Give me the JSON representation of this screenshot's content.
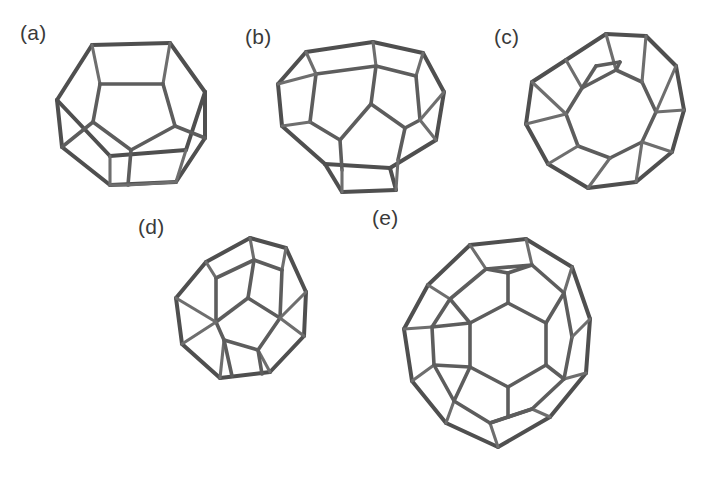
{
  "figure": {
    "type": "line-drawing-figure",
    "background_color": "#ffffff",
    "stroke_color": "#5d5d5d",
    "panel_count": 5
  },
  "panels": [
    {
      "id": "a",
      "label": "(a)",
      "label_x": 20,
      "label_y": 22,
      "shape_name": "pentagonal-dodecahedron",
      "faces": 12,
      "vertices": 20,
      "edges": 30,
      "box": {
        "x": 50,
        "y": 30,
        "width": 162,
        "height": 158
      }
    },
    {
      "id": "b",
      "label": "(b)",
      "label_x": 245,
      "label_y": 26,
      "shape_name": "tetrakaidecahedron",
      "faces": 14,
      "vertices": 24,
      "edges": 36,
      "box": {
        "x": 262,
        "y": 33,
        "width": 192,
        "height": 155
      }
    },
    {
      "id": "c",
      "label": "(c)",
      "label_x": 494,
      "label_y": 26,
      "shape_name": "hexakaidecahedron",
      "faces": 16,
      "vertices": 28,
      "edges": 42,
      "box": {
        "x": 508,
        "y": 26,
        "width": 180,
        "height": 172
      }
    },
    {
      "id": "d",
      "label": "(d)",
      "label_x": 138,
      "label_y": 216,
      "shape_name": "truncated-octahedron",
      "faces": 14,
      "vertices": 24,
      "edges": 36,
      "box": {
        "x": 160,
        "y": 232,
        "width": 165,
        "height": 158
      }
    },
    {
      "id": "e",
      "label": "(e)",
      "label_x": 378,
      "label_y": 210,
      "shape_name": "icosakaidecahedron",
      "faces": 20,
      "vertices": 36,
      "edges": 54,
      "box": {
        "x": 378,
        "y": 228,
        "width": 222,
        "height": 232
      }
    }
  ]
}
